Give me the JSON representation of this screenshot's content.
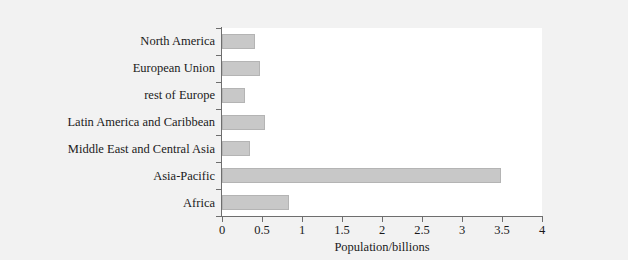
{
  "chart_data": {
    "type": "bar",
    "orientation": "horizontal",
    "title": "",
    "xlabel": "Population/billions",
    "ylabel": "",
    "categories": [
      "North America",
      "European Union",
      "rest of Europe",
      "Latin America and Caribbean",
      "Middle East and Central Asia",
      "Asia-Pacific",
      "Africa"
    ],
    "values": [
      0.41,
      0.47,
      0.29,
      0.54,
      0.35,
      3.49,
      0.84
    ],
    "xlim": [
      0,
      4
    ],
    "xticks": [
      0,
      0.5,
      1,
      1.5,
      2,
      2.5,
      3,
      3.5,
      4
    ],
    "xtick_labels": [
      "0",
      "0.5",
      "1",
      "1.5",
      "2",
      "2.5",
      "3",
      "3.5",
      "4"
    ],
    "grid": false,
    "legend": null,
    "bar_color": "#c8c8c8",
    "bar_edge_color": "#b4b4b4",
    "axis_color": "#6e6e6e",
    "plot_background": "#ffffff",
    "figure_background": "#f2f2f2",
    "text_color": "#1a1a1a"
  }
}
